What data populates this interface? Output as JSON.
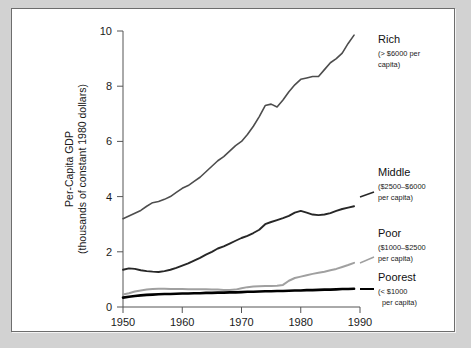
{
  "chart_data": {
    "type": "line",
    "title": "",
    "xlabel": "",
    "ylabel": "Per-Capita GDP",
    "ylabel_line2": "(thousands of constant 1980 dollars)",
    "xlim": [
      1950,
      1990
    ],
    "ylim": [
      0,
      10
    ],
    "grid": false,
    "legend_position": "right-inline-annotations",
    "xticks": [
      "1950",
      "1960",
      "1970",
      "1980",
      "1990"
    ],
    "xtick_values": [
      1950,
      1960,
      1970,
      1980,
      1990
    ],
    "yticks": [
      "0",
      "2",
      "4",
      "6",
      "8",
      "10"
    ],
    "ytick_values": [
      0,
      2,
      4,
      6,
      8,
      10
    ],
    "x": [
      1950,
      1951,
      1952,
      1953,
      1954,
      1955,
      1956,
      1957,
      1958,
      1959,
      1960,
      1961,
      1962,
      1963,
      1964,
      1965,
      1966,
      1967,
      1968,
      1969,
      1970,
      1971,
      1972,
      1973,
      1974,
      1975,
      1976,
      1977,
      1978,
      1979,
      1980,
      1981,
      1982,
      1983,
      1984,
      1985,
      1986,
      1987,
      1988,
      1989
    ],
    "series": [
      {
        "name": "Rich",
        "sublabel_line1": "(> $6000 per",
        "sublabel_line2": "capita)",
        "color": "#4d4d4d",
        "width": 1.6,
        "values": [
          3.2,
          3.3,
          3.4,
          3.5,
          3.65,
          3.78,
          3.82,
          3.9,
          4.0,
          4.15,
          4.3,
          4.4,
          4.55,
          4.7,
          4.9,
          5.1,
          5.3,
          5.45,
          5.65,
          5.85,
          6.0,
          6.25,
          6.55,
          6.9,
          7.3,
          7.35,
          7.25,
          7.5,
          7.8,
          8.05,
          8.25,
          8.3,
          8.35,
          8.35,
          8.6,
          8.85,
          9.0,
          9.2,
          9.55,
          9.85
        ]
      },
      {
        "name": "Middle",
        "sublabel_line1": "($2500–$6000",
        "sublabel_line2": "per capita)",
        "color": "#272727",
        "width": 1.9,
        "values": [
          1.35,
          1.4,
          1.38,
          1.33,
          1.3,
          1.28,
          1.27,
          1.3,
          1.35,
          1.42,
          1.5,
          1.58,
          1.68,
          1.78,
          1.9,
          2.0,
          2.12,
          2.2,
          2.3,
          2.4,
          2.5,
          2.58,
          2.68,
          2.8,
          3.0,
          3.08,
          3.15,
          3.22,
          3.3,
          3.42,
          3.48,
          3.42,
          3.35,
          3.33,
          3.35,
          3.4,
          3.48,
          3.55,
          3.6,
          3.65
        ]
      },
      {
        "name": "Poor",
        "sublabel_line1": "($1000–$2500",
        "sublabel_line2": "per capita)",
        "color": "#a0a0a0",
        "width": 2.0,
        "values": [
          0.45,
          0.5,
          0.56,
          0.6,
          0.63,
          0.65,
          0.66,
          0.66,
          0.65,
          0.65,
          0.65,
          0.64,
          0.64,
          0.64,
          0.64,
          0.63,
          0.63,
          0.62,
          0.62,
          0.63,
          0.68,
          0.72,
          0.74,
          0.75,
          0.76,
          0.76,
          0.77,
          0.8,
          0.95,
          1.05,
          1.1,
          1.15,
          1.2,
          1.24,
          1.28,
          1.33,
          1.38,
          1.45,
          1.52,
          1.6
        ]
      },
      {
        "name": "Poorest",
        "sublabel_line1": "(< $1000",
        "sublabel_line2": "per capita)",
        "color": "#000000",
        "width": 2.6,
        "values": [
          0.34,
          0.37,
          0.4,
          0.42,
          0.44,
          0.45,
          0.46,
          0.47,
          0.47,
          0.48,
          0.49,
          0.49,
          0.5,
          0.5,
          0.51,
          0.51,
          0.52,
          0.52,
          0.53,
          0.53,
          0.54,
          0.55,
          0.55,
          0.56,
          0.57,
          0.57,
          0.58,
          0.58,
          0.59,
          0.6,
          0.6,
          0.61,
          0.61,
          0.62,
          0.63,
          0.63,
          0.64,
          0.65,
          0.65,
          0.66
        ]
      }
    ]
  },
  "labels": {
    "rich": "Rich",
    "rich_sub1": "(> $6000 per",
    "rich_sub2": "capita)",
    "middle": "Middle",
    "middle_sub1": "($2500–$6000",
    "middle_sub2": "per capita)",
    "poor": "Poor",
    "poor_sub1": "($1000–$2500",
    "poor_sub2": "per capita)",
    "poorest": "Poorest",
    "poorest_sub1": "(< $1000",
    "poorest_sub2": "per capita)",
    "y_axis_line1": "Per-Capita GDP",
    "y_axis_line2": "(thousands of constant 1980 dollars)",
    "ytick_0": "0",
    "ytick_2": "2",
    "ytick_4": "4",
    "ytick_6": "6",
    "ytick_8": "8",
    "ytick_10": "10",
    "xtick_1950": "1950",
    "xtick_1960": "1960",
    "xtick_1970": "1970",
    "xtick_1980": "1980",
    "xtick_1990": "1990"
  }
}
